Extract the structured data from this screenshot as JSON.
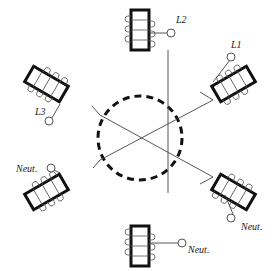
{
  "diagram": {
    "labels": {
      "l1": "L1",
      "l2": "L2",
      "l3": "L3",
      "neut_left": "Neut.",
      "neut_right": "Neut.",
      "neut_bottom": "Neut."
    },
    "colors": {
      "stroke": "#111111",
      "thin": "#444444",
      "background": "#ffffff"
    },
    "coils": [
      {
        "id": "top",
        "angle": 0
      },
      {
        "id": "upper-right",
        "angle": 60
      },
      {
        "id": "lower-right",
        "angle": 120
      },
      {
        "id": "bottom",
        "angle": 180
      },
      {
        "id": "lower-left",
        "angle": 240
      },
      {
        "id": "upper-left",
        "angle": 300
      }
    ],
    "center_circle": {
      "style": "dashed",
      "radius": 42
    }
  }
}
